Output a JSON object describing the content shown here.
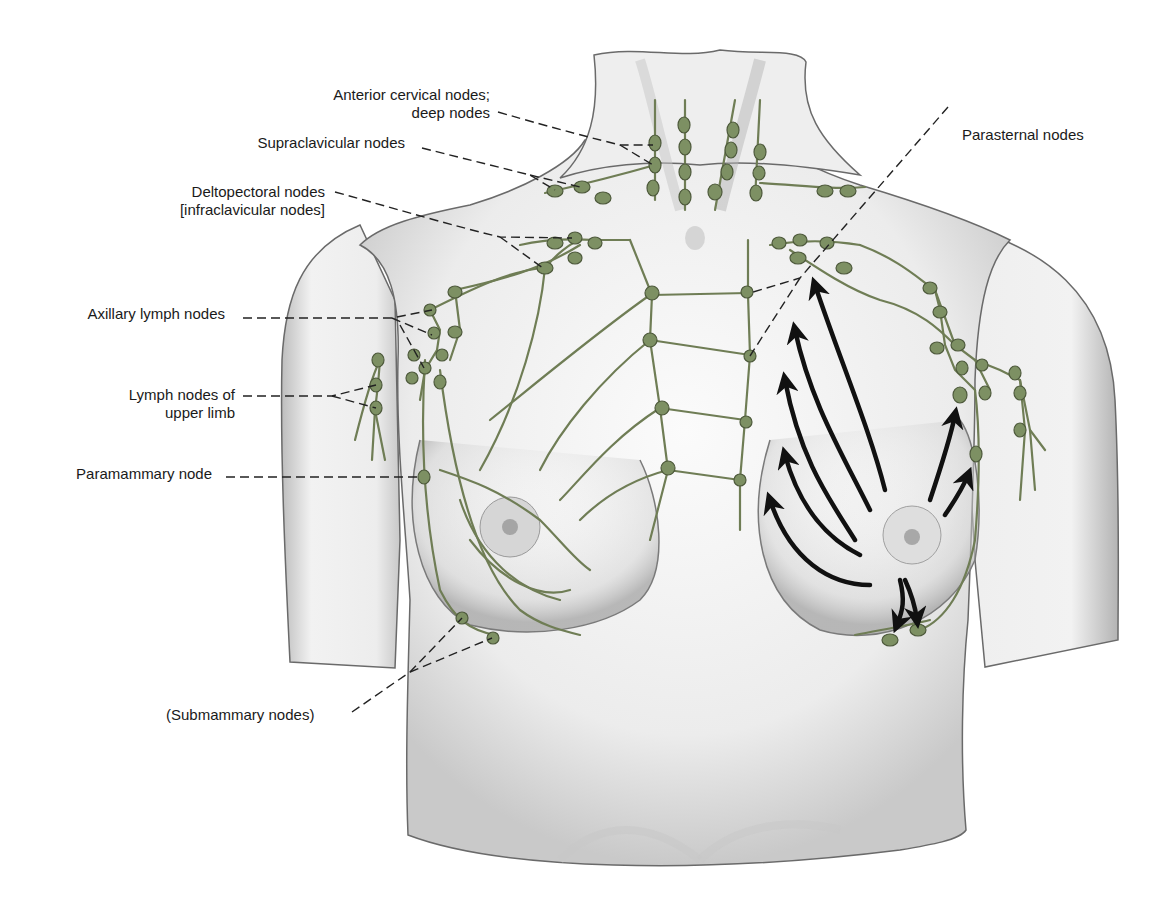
{
  "figure": {
    "colors": {
      "background": "#ffffff",
      "skin": "#f3f3f3",
      "skin_shadow": "#bdbdbd",
      "outline": "#5a5a5a",
      "lymph_vessel": "#6f7d55",
      "lymph_node": "#7d9063",
      "lymph_node_edge": "#4e5a3c",
      "leader_line": "#222222",
      "arrow": "#111111",
      "label_text": "#1a1a1a"
    }
  },
  "labels": {
    "anterior_cervical": {
      "line1": "Anterior cervical nodes;",
      "line2": "deep nodes"
    },
    "supraclavicular": {
      "line1": "Supraclavicular nodes"
    },
    "deltopectoral": {
      "line1": "Deltopectoral nodes",
      "line2": "[infraclavicular nodes]"
    },
    "axillary": {
      "line1": "Axillary lymph nodes"
    },
    "upper_limb": {
      "line1": "Lymph nodes of",
      "line2": "upper limb"
    },
    "paramammary": {
      "line1": "Paramammary node"
    },
    "submammary": {
      "line1": "(Submammary nodes)"
    },
    "parasternal": {
      "line1": "Parasternal nodes"
    }
  },
  "arrows": {
    "description": "Direction of lymph flow from the right-side breast toward axillary, parasternal and submammary nodes",
    "count": 9
  }
}
